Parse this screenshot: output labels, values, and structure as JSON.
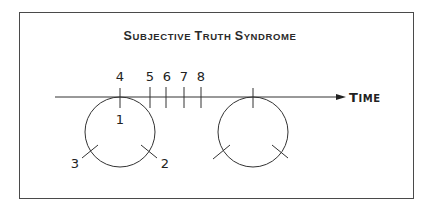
{
  "diagram": {
    "title": "Subjective Truth Syndrome",
    "title_display": {
      "s1": "S",
      "r1": "UBJECTIVE ",
      "s2": "T",
      "r2": "RUTH ",
      "s3": "S",
      "r3": "YNDROME"
    },
    "axis_label": "Time",
    "axis_label_display": {
      "s": "T",
      "r": "IME"
    },
    "timeline_ticks": [
      {
        "label": "4",
        "x": 120
      },
      {
        "label": "5",
        "x": 150
      },
      {
        "label": "6",
        "x": 166
      },
      {
        "label": "7",
        "x": 184
      },
      {
        "label": "8",
        "x": 201
      }
    ],
    "circle_labels": {
      "top": "1",
      "lower_right": "2",
      "lower_left": "3"
    },
    "colors": {
      "stroke": "#333333",
      "border": "#4a4a4a",
      "text": "#222222"
    }
  }
}
